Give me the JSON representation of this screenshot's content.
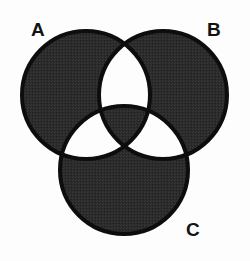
{
  "figure": {
    "kind": "venn-diagram-3-set",
    "title": "",
    "background_color": "#fdfdfd",
    "width": 250,
    "height": 261
  },
  "style": {
    "fill_color": "#2b2b2b",
    "stroke_color": "#0d0d0d",
    "empty_color": "#fdfdfd",
    "stroke_width": 4,
    "label_color": "#121212"
  },
  "sets": [
    {
      "id": "A",
      "label": "A",
      "label_position": "top-left",
      "cx": 86,
      "cy": 95,
      "r": 64
    },
    {
      "id": "B",
      "label": "B",
      "label_position": "top-right",
      "cx": 163,
      "cy": 95,
      "r": 64
    },
    {
      "id": "C",
      "label": "C",
      "label_position": "bottom-right",
      "cx": 124,
      "cy": 170,
      "r": 64
    }
  ],
  "regions": [
    {
      "id": "A-only",
      "expression": "A \\ (B ∪ C)",
      "shaded": true
    },
    {
      "id": "B-only",
      "expression": "B \\ (A ∪ C)",
      "shaded": true
    },
    {
      "id": "C-only",
      "expression": "C \\ (A ∪ B)",
      "shaded": true
    },
    {
      "id": "AB-only",
      "expression": "(A ∩ B) \\ C",
      "shaded": false
    },
    {
      "id": "AC-only",
      "expression": "(A ∩ C) \\ B",
      "shaded": false
    },
    {
      "id": "BC-only",
      "expression": "(B ∩ C) \\ A",
      "shaded": false
    },
    {
      "id": "ABC",
      "expression": "A ∩ B ∩ C",
      "shaded": true
    }
  ],
  "chart_data": {
    "type": "diagram",
    "subtype": "venn",
    "set_count": 3,
    "categories": [
      "A",
      "B",
      "C"
    ],
    "title": "",
    "shaded_regions": [
      "A-only",
      "B-only",
      "C-only",
      "A ∩ B ∩ C"
    ],
    "unshaded_regions": [
      "(A ∩ B) \\ C",
      "(A ∩ C) \\ B",
      "(B ∩ C) \\ A"
    ],
    "legend": "none",
    "grid": false
  }
}
